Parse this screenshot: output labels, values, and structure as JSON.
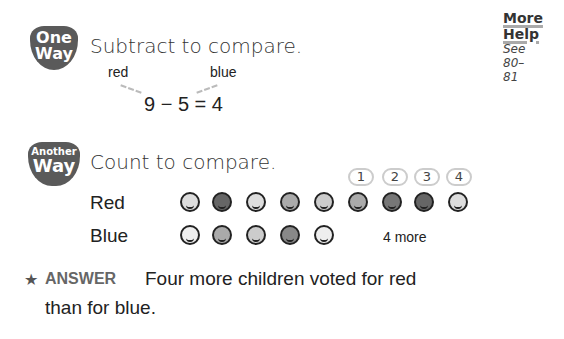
{
  "one_way": {
    "badge_line1": "One",
    "badge_line2": "Way",
    "title": "Subtract to compare.",
    "label_red": "red",
    "label_blue": "blue",
    "equation": "9 − 5 = 4"
  },
  "more_help": {
    "title_line1": "More",
    "title_line2": "Help",
    "see_line1": "See",
    "see_line2": "80–",
    "see_line3": "81"
  },
  "another_way": {
    "badge_line1": "Another",
    "badge_line2": "Way",
    "title": "Count to compare.",
    "rows": [
      {
        "label": "Red",
        "count": 9,
        "tones": [
          "#ddd",
          "#666",
          "#ddd",
          "#aaa",
          "#ccc",
          "#aaa",
          "#777",
          "#666",
          "#ddd"
        ]
      },
      {
        "label": "Blue",
        "count": 5,
        "tones": [
          "#eee",
          "#aaa",
          "#ccc",
          "#888",
          "#eee"
        ]
      }
    ],
    "count_labels": [
      "1",
      "2",
      "3",
      "4"
    ],
    "difference_label": "4 more"
  },
  "answer": {
    "label": "ANSWER",
    "line1": "Four more children voted for red",
    "line2": "than for blue."
  },
  "icons": {
    "star": "★"
  }
}
